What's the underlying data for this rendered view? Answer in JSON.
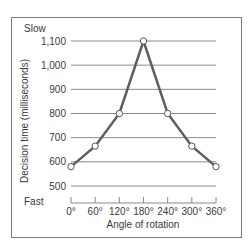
{
  "chart_data": {
    "type": "line",
    "title": "",
    "xlabel": "Angle of rotation",
    "ylabel": "Decision time (milliseconds)",
    "x": [
      "0°",
      "60°",
      "120°",
      "180°",
      "240°",
      "300°",
      "360°"
    ],
    "series": [
      {
        "name": "Decision time",
        "values": [
          580,
          665,
          800,
          1100,
          800,
          665,
          580
        ]
      }
    ],
    "y_ticks": [
      "500",
      "600",
      "700",
      "800",
      "900",
      "1,000",
      "1,100"
    ],
    "ylim": [
      500,
      1100
    ],
    "grid": true,
    "annotations": {
      "top": "Slow",
      "bottom": "Fast"
    },
    "legend": null,
    "colors": {
      "line": "#5e5e5e",
      "grid": "#8a8a8a",
      "marker_fill": "#ffffff",
      "marker_stroke": "#555555",
      "frame": "#7a7a7a",
      "text": "#3a3a3a"
    }
  }
}
